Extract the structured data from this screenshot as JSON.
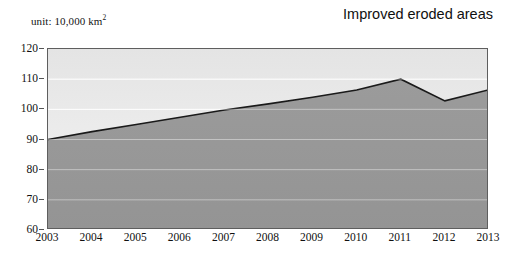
{
  "header": {
    "unit_label": "unit: 10,000 km",
    "unit_exponent": "2",
    "title": "Improved eroded areas"
  },
  "colors": {
    "upper_fill_top": "#e6e6e6",
    "upper_fill_bottom": "#f4f4f4",
    "lower_fill": "#9a9a9a",
    "line": "#1a1a1a",
    "frame": "#5e5e5e",
    "gridline": "#d8d8d8",
    "text": "#111111"
  },
  "chart_data": {
    "type": "area",
    "title": "Improved eroded areas",
    "xlabel": "",
    "ylabel": "",
    "unit": "10,000 km^2",
    "x": [
      2003,
      2004,
      2005,
      2006,
      2007,
      2008,
      2009,
      2010,
      2011,
      2012,
      2013
    ],
    "categories": [
      "2003",
      "2004",
      "2005",
      "2006",
      "2007",
      "2008",
      "2009",
      "2010",
      "2011",
      "2012",
      "2013"
    ],
    "series": [
      {
        "name": "Improved eroded areas",
        "values": [
          90.0,
          92.6,
          95.0,
          97.4,
          99.8,
          101.8,
          104.0,
          106.4,
          110.0,
          102.8,
          106.5
        ]
      }
    ],
    "values": [
      90.0,
      92.6,
      95.0,
      97.4,
      99.8,
      101.8,
      104.0,
      106.4,
      110.0,
      102.8,
      106.5
    ],
    "ylim": [
      60,
      120
    ],
    "ytick_values": [
      60,
      70,
      80,
      90,
      100,
      110,
      120
    ],
    "ytick_labels": [
      "60",
      "70",
      "80",
      "90",
      "100",
      "110",
      "120"
    ],
    "xtick_labels": [
      "2003",
      "2004",
      "2005",
      "2006",
      "2007",
      "2008",
      "2009",
      "2010",
      "2011",
      "2012",
      "2013"
    ],
    "grid": true,
    "legend": "none"
  }
}
